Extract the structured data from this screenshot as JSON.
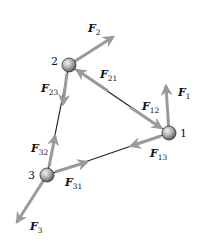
{
  "diagram": {
    "colors": {
      "arrow": "#9a9a9a",
      "line": "#222222",
      "ball_light": "#e6e6e6",
      "ball_dark": "#555555"
    },
    "particles": [
      {
        "id": "1",
        "label": "1",
        "x": 169,
        "y": 133
      },
      {
        "id": "2",
        "label": "2",
        "x": 69,
        "y": 65
      },
      {
        "id": "3",
        "label": "3",
        "x": 47,
        "y": 175
      }
    ],
    "forces": [
      {
        "id": "F1",
        "base": "F",
        "sub": "1",
        "label_x": 178,
        "label_y": 96
      },
      {
        "id": "F2",
        "base": "F",
        "sub": "2",
        "label_x": 88,
        "label_y": 34
      },
      {
        "id": "F3",
        "base": "F",
        "sub": "3",
        "label_x": 30,
        "label_y": 228
      },
      {
        "id": "F12",
        "base": "F",
        "sub": "12",
        "label_x": 142,
        "label_y": 110
      },
      {
        "id": "F21",
        "base": "F",
        "sub": "21",
        "label_x": 100,
        "label_y": 78
      },
      {
        "id": "F13",
        "base": "F",
        "sub": "13",
        "label_x": 150,
        "label_y": 158
      },
      {
        "id": "F31",
        "base": "F",
        "sub": "31",
        "label_x": 64,
        "label_y": 182
      },
      {
        "id": "F23",
        "base": "F",
        "sub": "23",
        "label_x": 40,
        "label_y": 94
      },
      {
        "id": "F32",
        "base": "F",
        "sub": "32",
        "label_x": 28,
        "label_y": 150
      }
    ]
  }
}
